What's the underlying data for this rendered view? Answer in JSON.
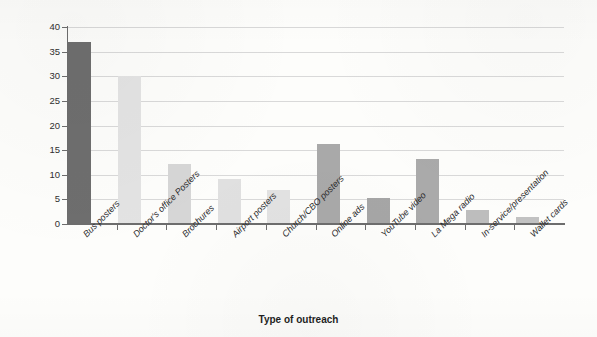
{
  "chart_data": {
    "type": "bar",
    "title": "",
    "subtitle": "",
    "xlabel": "Type of outreach",
    "ylabel": "% of households",
    "categories": [
      "Bus posters",
      "Doctor's office Posters",
      "Brochures",
      "Airport posters",
      "Church/CBO posters",
      "Online ads",
      "YouTube video",
      "La Mega radio",
      "In-service/presentation",
      "Wallet cards"
    ],
    "values": [
      37,
      30,
      12.1,
      9.2,
      7.0,
      16.2,
      5.2,
      13.2,
      2.8,
      1.5
    ],
    "bar_colors": [
      "#6e6e6e",
      "#e3e3e3",
      "#d6d6d6",
      "#e0e0e0",
      "#e2e2e2",
      "#a9a9a9",
      "#a6a6a6",
      "#aaaaaa",
      "#bdbdbd",
      "#c2c2c2"
    ],
    "ylim": [
      0,
      40
    ],
    "ytick_values": [
      0,
      5,
      10,
      15,
      20,
      25,
      30,
      35,
      40
    ],
    "ytick_labels": [
      "0",
      "5",
      "10",
      "15",
      "20",
      "25",
      "30",
      "35",
      "40"
    ],
    "grid": "horizontal",
    "legend": "none",
    "xtick_rotation": -45,
    "axis_color": "#6d6d6d",
    "gridline_color": "#d9d9d9",
    "background_color": "#fdfdfb"
  }
}
